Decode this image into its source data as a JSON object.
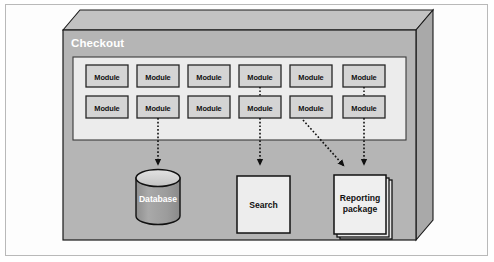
{
  "diagram": {
    "type": "architecture-3d-box",
    "title": "Checkout",
    "title_color": "#ffffff",
    "box": {
      "face_color": "#b5b5b5",
      "top_color": "#c2c2c2",
      "side_color": "#a8a8a8",
      "stroke_color": "#1a1a1a"
    },
    "module_panel": {
      "name": "module-panel",
      "fill": "#ececec",
      "stroke": "#3a3a3a",
      "rows": 2,
      "columns": 6,
      "module_label": "Module",
      "module_fill": "#d4d4d4",
      "module_stroke": "#262626",
      "modules": [
        {
          "id": "m-r1-c1",
          "row": 1,
          "col": 1,
          "label": "Module"
        },
        {
          "id": "m-r1-c2",
          "row": 1,
          "col": 2,
          "label": "Module"
        },
        {
          "id": "m-r1-c3",
          "row": 1,
          "col": 3,
          "label": "Module"
        },
        {
          "id": "m-r1-c4",
          "row": 1,
          "col": 4,
          "label": "Module"
        },
        {
          "id": "m-r1-c5",
          "row": 1,
          "col": 5,
          "label": "Module"
        },
        {
          "id": "m-r1-c6",
          "row": 1,
          "col": 6,
          "label": "Module"
        },
        {
          "id": "m-r2-c1",
          "row": 2,
          "col": 1,
          "label": "Module"
        },
        {
          "id": "m-r2-c2",
          "row": 2,
          "col": 2,
          "label": "Module"
        },
        {
          "id": "m-r2-c3",
          "row": 2,
          "col": 3,
          "label": "Module"
        },
        {
          "id": "m-r2-c4",
          "row": 2,
          "col": 4,
          "label": "Module"
        },
        {
          "id": "m-r2-c5",
          "row": 2,
          "col": 5,
          "label": "Module"
        },
        {
          "id": "m-r2-c6",
          "row": 2,
          "col": 6,
          "label": "Module"
        }
      ]
    },
    "resources": [
      {
        "id": "database",
        "shape": "cylinder",
        "label": "Database",
        "label_color": "#ffffff",
        "fill": "#9e9e9e",
        "top_fill": "#d8d8d8",
        "stroke": "#111111"
      },
      {
        "id": "search",
        "shape": "rectangle",
        "label": "Search",
        "label_color": "#111111",
        "fill": "#ededed",
        "stroke": "#111111"
      },
      {
        "id": "reporting-package",
        "shape": "document-stack",
        "label": "Reporting\npackage",
        "label_line_1": "Reporting",
        "label_line_2": "package",
        "label_color": "#111111",
        "fill": "#ededed",
        "stroke": "#111111",
        "stack_count": 3
      }
    ],
    "connections": [
      {
        "id": "conn-module-to-database",
        "from": "m-r2-c2",
        "to": "database",
        "style": "dotted",
        "arrow": "filled-triangle"
      },
      {
        "id": "conn-module-to-search-upper",
        "from": "m-r1-c4",
        "to": "m-r2-c4",
        "style": "dotted",
        "arrow": "none"
      },
      {
        "id": "conn-module-to-search",
        "from": "m-r2-c4",
        "to": "search",
        "style": "dotted",
        "arrow": "filled-triangle"
      },
      {
        "id": "conn-module-to-reporting-diagonal",
        "from": "m-r2-c5",
        "to": "reporting-package",
        "style": "dotted",
        "arrow": "filled-triangle"
      },
      {
        "id": "conn-module-to-reporting-upper",
        "from": "m-r1-c6",
        "to": "m-r2-c6",
        "style": "dotted",
        "arrow": "none"
      },
      {
        "id": "conn-module-to-reporting",
        "from": "m-r2-c6",
        "to": "reporting-package",
        "style": "dotted",
        "arrow": "filled-triangle"
      }
    ]
  }
}
